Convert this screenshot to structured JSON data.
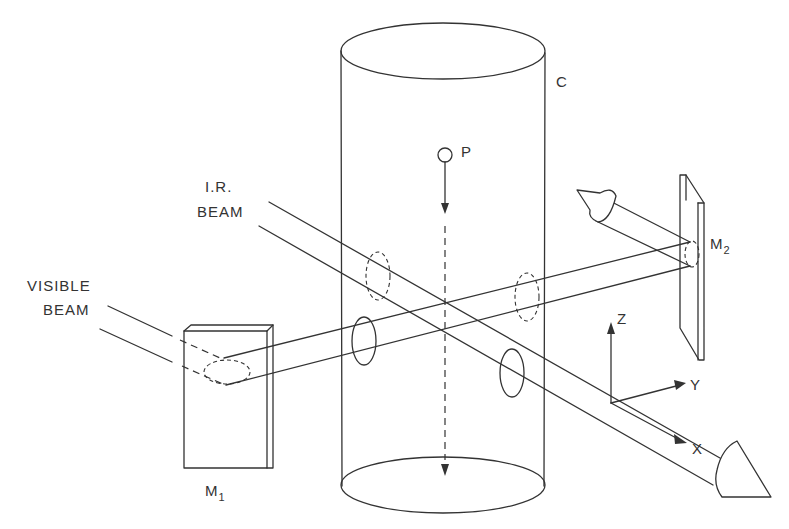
{
  "figure": {
    "type": "optical-setup-schematic",
    "background_color": "#ffffff",
    "line_color": "#333333"
  },
  "labels": {
    "cylinder": "C",
    "particle": "P",
    "ir_beam_line1": "I.R.",
    "ir_beam_line2": "BEAM",
    "visible_beam_line1": "VISIBLE",
    "visible_beam_line2": "BEAM",
    "mirror1_main": "M",
    "mirror1_sub": "1",
    "mirror2_main": "M",
    "mirror2_sub": "2",
    "axis_x": "X",
    "axis_y": "Y",
    "axis_z": "Z"
  },
  "components": [
    {
      "id": "cylinder",
      "label": "C",
      "description": "Vertical transparent cylinder (chamber)"
    },
    {
      "id": "particle",
      "label": "P",
      "description": "Particle falling along dashed vertical path with downward arrow"
    },
    {
      "id": "mirror1",
      "label": "M1",
      "description": "Mirror reflecting visible beam toward cylinder"
    },
    {
      "id": "mirror2",
      "label": "M2",
      "description": "Mirror reflecting visible beam back out (arrow exiting upper-left)"
    },
    {
      "id": "ir-beam",
      "label": "I.R. BEAM",
      "description": "Infrared beam traversing cylinder diagonally, exiting lower-right with cone arrow"
    },
    {
      "id": "visible-beam",
      "label": "VISIBLE BEAM",
      "description": "Visible beam entering from left, reflected by M1 through cylinder to M2"
    },
    {
      "id": "axes",
      "labels": [
        "X",
        "Y",
        "Z"
      ],
      "description": "Coordinate axes triad"
    }
  ]
}
